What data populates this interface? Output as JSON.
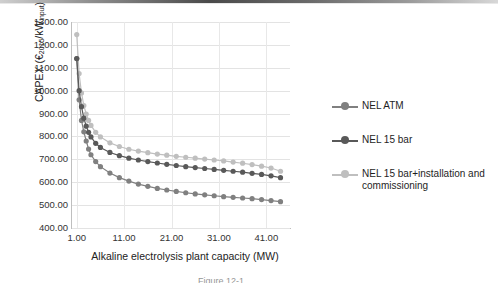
{
  "chart_data": {
    "type": "line",
    "title": "",
    "xlabel": "Alkaline electrolysis plant capacity (MW)",
    "ylabel": "CAPEX (€2015/kWinput)",
    "ylabel_parts": {
      "pre": "CAPEX (€",
      "sub1": "2015",
      "mid": "/kW",
      "sub2": "input",
      "post": ")"
    },
    "xlim": [
      0,
      46
    ],
    "ylim": [
      400,
      1300
    ],
    "grid": true,
    "legend_position": "right",
    "xticks": [
      "1.00",
      "11.00",
      "21.00",
      "31.00",
      "41.00"
    ],
    "xtick_values": [
      1,
      11,
      21,
      31,
      41
    ],
    "yticks": [
      "400.00",
      "500.00",
      "600.00",
      "700.00",
      "800.00",
      "900.00",
      "1000.00",
      "1100.00",
      "1200.00",
      "1300.00"
    ],
    "ytick_values": [
      400,
      500,
      600,
      700,
      800,
      900,
      1000,
      1100,
      1200,
      1300
    ],
    "colors": {
      "nel_atm": "#808080",
      "nel_15bar": "#595959",
      "nel_15bar_install": "#bfbfbf"
    },
    "series": [
      {
        "name": "NEL ATM",
        "color": "#808080",
        "x": [
          1,
          1.5,
          2,
          2.5,
          3,
          3.5,
          4,
          5,
          6,
          8,
          10,
          12,
          14,
          16,
          18,
          20,
          22,
          24,
          26,
          28,
          30,
          32,
          34,
          36,
          38,
          40,
          42,
          44
        ],
        "values": [
          1140,
          960,
          870,
          820,
          780,
          745,
          720,
          690,
          668,
          640,
          620,
          605,
          592,
          582,
          573,
          566,
          560,
          554,
          549,
          545,
          541,
          537,
          534,
          531,
          528,
          524,
          520,
          515
        ]
      },
      {
        "name": "NEL 15 bar",
        "color": "#595959",
        "x": [
          1,
          1.5,
          2,
          2.5,
          3,
          3.5,
          4,
          5,
          6,
          8,
          10,
          12,
          14,
          16,
          18,
          20,
          22,
          24,
          26,
          28,
          30,
          32,
          34,
          36,
          38,
          40,
          42,
          44
        ],
        "values": [
          1140,
          1000,
          930,
          880,
          845,
          818,
          798,
          770,
          752,
          730,
          716,
          705,
          697,
          690,
          684,
          678,
          673,
          668,
          664,
          660,
          656,
          652,
          648,
          644,
          639,
          634,
          628,
          620
        ]
      },
      {
        "name": "NEL 15 bar+installation and commissioning",
        "color": "#bfbfbf",
        "x": [
          1,
          1.5,
          2,
          2.5,
          3,
          3.5,
          4,
          5,
          6,
          8,
          10,
          12,
          14,
          16,
          18,
          20,
          22,
          24,
          26,
          28,
          30,
          32,
          34,
          36,
          38,
          40,
          42,
          44
        ],
        "values": [
          1245,
          1075,
          990,
          935,
          898,
          870,
          848,
          818,
          798,
          772,
          756,
          744,
          736,
          729,
          723,
          718,
          713,
          709,
          705,
          701,
          697,
          693,
          688,
          683,
          677,
          670,
          662,
          648
        ]
      }
    ]
  },
  "legend": {
    "items": [
      {
        "label": "NEL ATM"
      },
      {
        "label": "NEL 15 bar"
      },
      {
        "label": "NEL 15 bar+installation and",
        "label2": "commissioning"
      }
    ]
  },
  "caption_fragment": "Figure 12-1"
}
